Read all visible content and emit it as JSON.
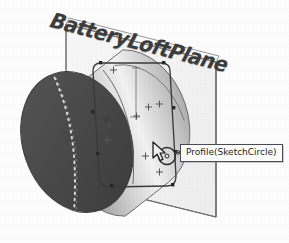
{
  "viewport": {
    "width": 289,
    "height": 243,
    "background_color": "#fdfdfd",
    "app_context": "cad-3d-viewport"
  },
  "plane": {
    "label": "BatteryLoftPlane",
    "label_color": "#3c3c3c",
    "fill_color": "#f2f2f2",
    "edge_color": "#6e6e6e"
  },
  "model": {
    "name": "battery-cylinder",
    "front_face_color": "#4a4a4a",
    "body_color": "#b9b9b9",
    "highlight_color": "#f4f4f4",
    "outline_color": "#5a5a5a",
    "hidden_edge_style": "dashed",
    "hidden_edge_color": "#cfcfcf"
  },
  "sketch": {
    "name": "SketchCircle",
    "profile_shape": "rounded-rectangle",
    "profile_color": "#3a3a3a",
    "point_color": "#2b2b2b",
    "construction_marker": "+",
    "construction_marker_color": "#555555",
    "markers": [
      {
        "id": "m1",
        "x": 113,
        "y": 70
      },
      {
        "id": "m2",
        "x": 148,
        "y": 107
      },
      {
        "id": "m3",
        "x": 108,
        "y": 140
      },
      {
        "id": "m4",
        "x": 160,
        "y": 107
      },
      {
        "id": "m5",
        "x": 159,
        "y": 175
      },
      {
        "id": "m6",
        "x": 137,
        "y": 119
      }
    ],
    "endpoints": [
      {
        "id": "p1",
        "x": 101,
        "y": 63
      },
      {
        "id": "p2",
        "x": 164,
        "y": 70
      },
      {
        "id": "p3",
        "x": 174,
        "y": 108
      },
      {
        "id": "p4",
        "x": 176,
        "y": 152
      },
      {
        "id": "p5",
        "x": 173,
        "y": 185
      },
      {
        "id": "p6",
        "x": 112,
        "y": 186
      }
    ]
  },
  "selection": {
    "tooltip_text": "Profile(SketchCircle)",
    "tooltip_bg": "#ffffff",
    "tooltip_border": "#4a4a55",
    "highlight_circle_color": "#2a2a2a"
  },
  "cursor": {
    "type": "circle-tool-cursor",
    "x": 151,
    "y": 141
  }
}
